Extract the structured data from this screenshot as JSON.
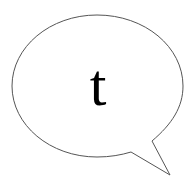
{
  "bubble": {
    "letter": "t",
    "stroke_color": "#555555",
    "fill_color": "#ffffff",
    "text_color": "#000000"
  }
}
